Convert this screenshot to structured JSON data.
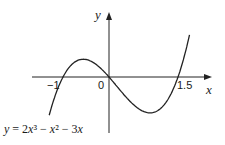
{
  "chart_data": {
    "type": "line",
    "title": "",
    "function": "y = 2x^3 - x^2 - 3x",
    "xlabel": "x",
    "ylabel": "y",
    "x_tick_labels": [
      "-1",
      "0",
      "1.5"
    ],
    "roots": [
      -1,
      0,
      1.5
    ],
    "xlim": [
      -1.35,
      1.85
    ],
    "ylim": [
      -3.5,
      3.2
    ],
    "grid": false,
    "legend": null,
    "series": [
      {
        "name": "y = 2x³ − x² − 3x",
        "x": [
          -1.3,
          -1.0,
          -0.75,
          -0.5,
          -0.434,
          -0.25,
          0,
          0.25,
          0.5,
          0.768,
          1.0,
          1.25,
          1.5,
          1.75
        ],
        "y": [
          -2.67,
          0,
          1.03,
          1.5,
          1.51,
          1.16,
          0,
          -0.78,
          -1.5,
          -1.82,
          -2.0,
          -1.41,
          0,
          2.41
        ]
      }
    ],
    "annotations": [
      "y = 2x³ − x² − 3x"
    ]
  },
  "labels": {
    "y_axis": "y",
    "x_axis": "x",
    "tick_neg1": "−1",
    "tick_0": "0",
    "tick_1_5": "1.5",
    "equation": "y = 2x³ − x² − 3x"
  }
}
